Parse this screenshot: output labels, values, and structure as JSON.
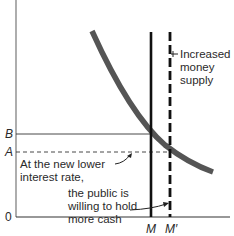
{
  "diagram": {
    "y_axis_labels": {
      "B": "B",
      "A": "A",
      "origin": "0"
    },
    "x_axis_labels": {
      "M": "M",
      "M_prime": "M′"
    },
    "annotations": {
      "increased_supply": [
        "Increased",
        "money",
        "supply"
      ],
      "lower_rate": [
        "At the new lower",
        "interest rate,"
      ],
      "public_holds": [
        "the public is",
        "willing to hold",
        "more cash"
      ]
    },
    "colors": {
      "curve": "#555555",
      "lines": "#111111",
      "text": "#2a2a2a"
    }
  }
}
